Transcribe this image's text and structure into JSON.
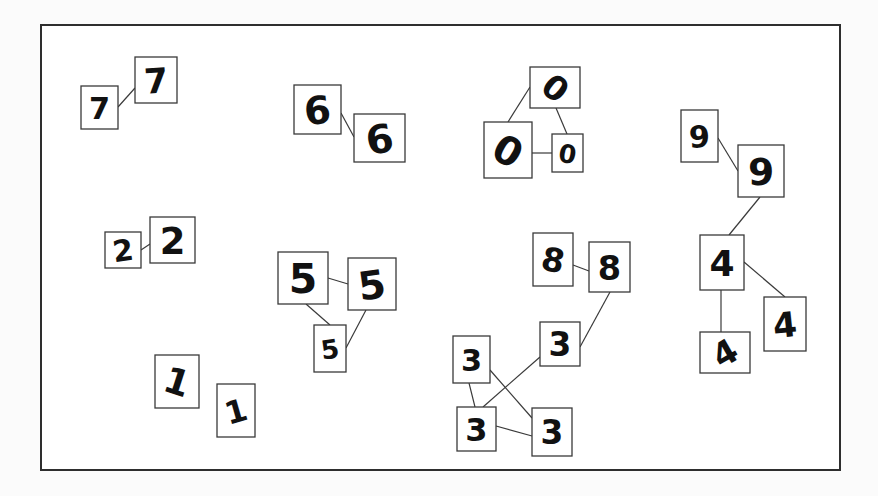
{
  "diagram": {
    "title": "",
    "frame": {
      "x": 41,
      "y": 25,
      "w": 799,
      "h": 445
    },
    "colors": {
      "frame": "#2e2e2e",
      "edge": "#3a3a3a",
      "box": "#3a3a3a",
      "ink": "#111111",
      "background": "#fbfbfb"
    },
    "clusters": [
      {
        "label": "7",
        "nodes": [
          {
            "id": "7a",
            "digit": "7",
            "x": 81,
            "y": 86,
            "w": 37,
            "h": 43,
            "style": "flat-top"
          },
          {
            "id": "7b",
            "digit": "7",
            "x": 135,
            "y": 57,
            "w": 42,
            "h": 46,
            "style": "crossed"
          }
        ],
        "edges": [
          [
            "7a",
            "7b"
          ]
        ]
      },
      {
        "label": "6",
        "nodes": [
          {
            "id": "6a",
            "digit": "6",
            "x": 294,
            "y": 85,
            "w": 47,
            "h": 49
          },
          {
            "id": "6b",
            "digit": "6",
            "x": 354,
            "y": 114,
            "w": 51,
            "h": 48
          }
        ],
        "edges": [
          [
            "6a",
            "6b"
          ]
        ]
      },
      {
        "label": "0",
        "nodes": [
          {
            "id": "0a",
            "digit": "0",
            "x": 530,
            "y": 67,
            "w": 50,
            "h": 41
          },
          {
            "id": "0b",
            "digit": "0",
            "x": 484,
            "y": 122,
            "w": 48,
            "h": 56
          },
          {
            "id": "0c",
            "digit": "0",
            "x": 552,
            "y": 134,
            "w": 31,
            "h": 38
          }
        ],
        "edges": [
          [
            "0a",
            "0b"
          ],
          [
            "0a",
            "0c"
          ],
          [
            "0b",
            "0c"
          ]
        ]
      },
      {
        "label": "9-4",
        "nodes": [
          {
            "id": "9a",
            "digit": "9",
            "x": 681,
            "y": 110,
            "w": 37,
            "h": 52
          },
          {
            "id": "9b",
            "digit": "9",
            "x": 738,
            "y": 145,
            "w": 46,
            "h": 52
          },
          {
            "id": "4a",
            "digit": "4",
            "x": 700,
            "y": 235,
            "w": 44,
            "h": 55
          },
          {
            "id": "4b",
            "digit": "4",
            "x": 764,
            "y": 297,
            "w": 42,
            "h": 54
          },
          {
            "id": "4c",
            "digit": "4",
            "x": 700,
            "y": 332,
            "w": 50,
            "h": 41
          }
        ],
        "edges": [
          [
            "9a",
            "9b"
          ],
          [
            "9b",
            "4a"
          ],
          [
            "4a",
            "4b"
          ],
          [
            "4a",
            "4c"
          ]
        ]
      },
      {
        "label": "2",
        "nodes": [
          {
            "id": "2a",
            "digit": "2",
            "x": 105,
            "y": 232,
            "w": 36,
            "h": 36
          },
          {
            "id": "2b",
            "digit": "2",
            "x": 150,
            "y": 217,
            "w": 45,
            "h": 46
          }
        ],
        "edges": [
          [
            "2a",
            "2b"
          ]
        ]
      },
      {
        "label": "5",
        "nodes": [
          {
            "id": "5a",
            "digit": "5",
            "x": 278,
            "y": 252,
            "w": 50,
            "h": 52
          },
          {
            "id": "5b",
            "digit": "5",
            "x": 348,
            "y": 258,
            "w": 48,
            "h": 52
          },
          {
            "id": "5c",
            "digit": "5",
            "x": 314,
            "y": 325,
            "w": 32,
            "h": 47
          }
        ],
        "edges": [
          [
            "5a",
            "5b"
          ],
          [
            "5a",
            "5c"
          ],
          [
            "5b",
            "5c"
          ]
        ]
      },
      {
        "label": "8-3",
        "nodes": [
          {
            "id": "8a",
            "digit": "8",
            "x": 533,
            "y": 233,
            "w": 40,
            "h": 53
          },
          {
            "id": "8b",
            "digit": "8",
            "x": 589,
            "y": 242,
            "w": 41,
            "h": 50
          },
          {
            "id": "3m",
            "digit": "3",
            "x": 540,
            "y": 322,
            "w": 40,
            "h": 44
          },
          {
            "id": "3a",
            "digit": "3",
            "x": 453,
            "y": 336,
            "w": 37,
            "h": 47
          },
          {
            "id": "3b",
            "digit": "3",
            "x": 457,
            "y": 407,
            "w": 39,
            "h": 44
          },
          {
            "id": "3c",
            "digit": "3",
            "x": 532,
            "y": 408,
            "w": 40,
            "h": 48
          }
        ],
        "edges": [
          [
            "8a",
            "8b"
          ],
          [
            "8b",
            "3m"
          ],
          [
            "3m",
            "3b"
          ],
          [
            "3a",
            "3b"
          ],
          [
            "3a",
            "3c"
          ],
          [
            "3b",
            "3c"
          ]
        ]
      },
      {
        "label": "1",
        "nodes": [
          {
            "id": "1a",
            "digit": "1",
            "x": 155,
            "y": 355,
            "w": 44,
            "h": 53
          },
          {
            "id": "1b",
            "digit": "1",
            "x": 217,
            "y": 384,
            "w": 38,
            "h": 53
          }
        ],
        "edges": [
          [
            "1a",
            "1b"
          ]
        ]
      }
    ],
    "edge_lines": [
      {
        "from": "7a",
        "to": "7b",
        "x1": 118,
        "y1": 107,
        "x2": 135,
        "y2": 88
      },
      {
        "from": "6a",
        "to": "6b",
        "x1": 341,
        "y1": 113,
        "x2": 354,
        "y2": 137
      },
      {
        "from": "0a",
        "to": "0b",
        "x1": 530,
        "y1": 87,
        "x2": 508,
        "y2": 122
      },
      {
        "from": "0a",
        "to": "0c",
        "x1": 556,
        "y1": 108,
        "x2": 567,
        "y2": 134
      },
      {
        "from": "0b",
        "to": "0c",
        "x1": 532,
        "y1": 153,
        "x2": 552,
        "y2": 153
      },
      {
        "from": "9a",
        "to": "9b",
        "x1": 718,
        "y1": 138,
        "x2": 738,
        "y2": 171
      },
      {
        "from": "9b",
        "to": "4a",
        "x1": 760,
        "y1": 197,
        "x2": 729,
        "y2": 235
      },
      {
        "from": "4a",
        "to": "4b",
        "x1": 744,
        "y1": 262,
        "x2": 785,
        "y2": 297
      },
      {
        "from": "4a",
        "to": "4c",
        "x1": 721,
        "y1": 290,
        "x2": 721,
        "y2": 332
      },
      {
        "from": "2a",
        "to": "2b",
        "x1": 141,
        "y1": 250,
        "x2": 150,
        "y2": 244
      },
      {
        "from": "5a",
        "to": "5b",
        "x1": 328,
        "y1": 278,
        "x2": 348,
        "y2": 284
      },
      {
        "from": "5a",
        "to": "5c",
        "x1": 306,
        "y1": 304,
        "x2": 330,
        "y2": 325
      },
      {
        "from": "5b",
        "to": "5c",
        "x1": 366,
        "y1": 310,
        "x2": 346,
        "y2": 348
      },
      {
        "from": "8a",
        "to": "8b",
        "x1": 573,
        "y1": 265,
        "x2": 589,
        "y2": 271
      },
      {
        "from": "8b",
        "to": "3m",
        "x1": 610,
        "y1": 292,
        "x2": 580,
        "y2": 347
      },
      {
        "from": "3m",
        "to": "3b",
        "x1": 540,
        "y1": 357,
        "x2": 483,
        "y2": 407
      },
      {
        "from": "3a",
        "to": "3b",
        "x1": 469,
        "y1": 383,
        "x2": 475,
        "y2": 407
      },
      {
        "from": "3a",
        "to": "3c",
        "x1": 490,
        "y1": 370,
        "x2": 532,
        "y2": 418
      },
      {
        "from": "3b",
        "to": "3c",
        "x1": 496,
        "y1": 426,
        "x2": 532,
        "y2": 436
      }
    ]
  }
}
